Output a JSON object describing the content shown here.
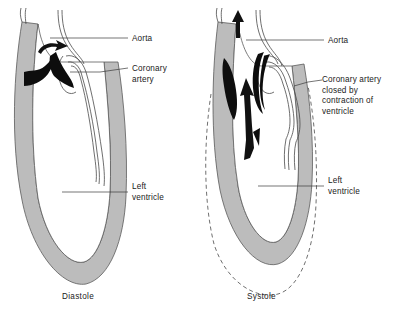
{
  "figure": {
    "colors": {
      "wall": "#bcbcbc",
      "lumen": "#ffffff",
      "valve_cusp": "#0d0d0d",
      "outline": "#5a5a5a",
      "leader": "#3a3a3a",
      "background": "#ffffff",
      "text": "#1a1a1a"
    }
  },
  "panels": [
    {
      "id": "diastole",
      "caption": "Diastole",
      "labels": [
        {
          "id": "aorta",
          "text": "Aorta"
        },
        {
          "id": "coronary-artery",
          "text_lines": [
            "Coronary",
            "artery"
          ]
        },
        {
          "id": "left-ventricle",
          "text_lines": [
            "Left",
            "ventricle"
          ]
        }
      ],
      "annotations": {
        "flow_arrow": "curved-arrow-right",
        "valve_state": "open",
        "wall_state": "relaxed-thin",
        "coronary_state": "open"
      }
    },
    {
      "id": "systole",
      "caption": "Systole",
      "labels": [
        {
          "id": "aorta",
          "text": "Aorta"
        },
        {
          "id": "coronary-artery-closed",
          "text_lines": [
            "Coronary artery",
            "closed by",
            "contraction of",
            "ventricle"
          ]
        },
        {
          "id": "left-ventricle",
          "text_lines": [
            "Left",
            "ventricle"
          ]
        }
      ],
      "annotations": {
        "flow_arrow_aorta": "straight-arrow-up-small",
        "flow_arrow_ventricle": "straight-arrow-up-large",
        "valve_state": "closed-against-wall",
        "wall_state": "contracted-thick",
        "coronary_state": "compressed",
        "diastolic_outline": "dashed"
      }
    }
  ]
}
